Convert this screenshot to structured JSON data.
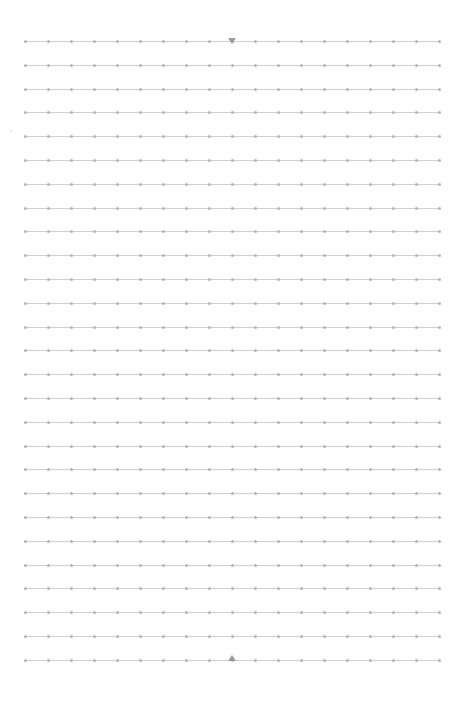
{
  "grid": {
    "rows": 27,
    "first_row_y": 41,
    "row_spacing": 23.8,
    "line_left": 24,
    "line_width": 416,
    "dots_per_row": 19,
    "dot_spacing": 23,
    "line_color": "#cfcfcf",
    "dot_color": "#b5b5b5"
  },
  "markers": {
    "top": {
      "x": 232,
      "y": 41,
      "direction": "down",
      "color": "#9a9a9a"
    },
    "bottom": {
      "x": 232,
      "y": 660,
      "direction": "up",
      "color": "#9a9a9a"
    }
  }
}
